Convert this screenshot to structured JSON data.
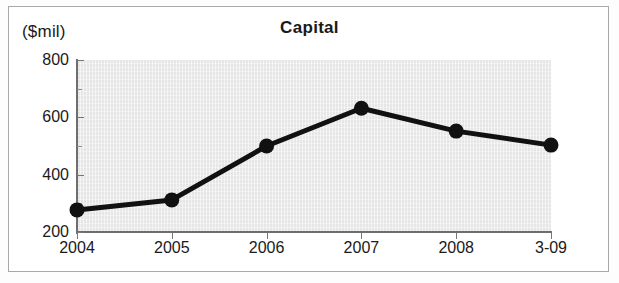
{
  "chart_data": {
    "type": "line",
    "title": "Capital",
    "ylabel": "($mil)",
    "xlabel": "",
    "categories": [
      "2004",
      "2005",
      "2006",
      "2007",
      "2008",
      "3-09"
    ],
    "values": [
      277,
      312,
      500,
      632,
      552,
      503
    ],
    "series": [
      {
        "name": "Capital",
        "values": [
          277,
          312,
          500,
          632,
          552,
          503
        ]
      }
    ],
    "ylim": [
      200,
      800
    ],
    "yticks": [
      200,
      400,
      600,
      800
    ],
    "ytick_labels": [
      "200",
      "400",
      "600",
      "800"
    ],
    "yminor_ticks": [
      300,
      500,
      700
    ],
    "grid": false,
    "legend": false,
    "marker": "filled-circle",
    "line_color": "#111111",
    "marker_color": "#111111",
    "plot_background": "#e6e6e6",
    "axis_color": "#6e6e6e"
  },
  "axis": {
    "y_label_text": "($mil)",
    "y_ticks": [
      {
        "label": "800",
        "value": 800
      },
      {
        "label": "600",
        "value": 600
      },
      {
        "label": "400",
        "value": 400
      },
      {
        "label": "200",
        "value": 200
      }
    ],
    "x_ticks": [
      {
        "label": "2004"
      },
      {
        "label": "2005"
      },
      {
        "label": "2006"
      },
      {
        "label": "2007"
      },
      {
        "label": "2008"
      },
      {
        "label": "3-09"
      }
    ]
  }
}
